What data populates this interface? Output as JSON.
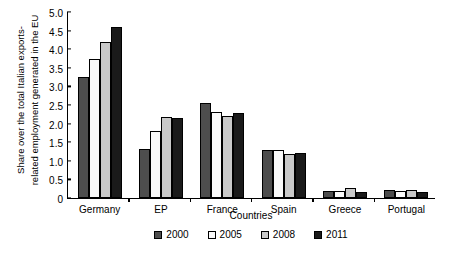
{
  "chart_data": {
    "type": "bar",
    "title": "",
    "xlabel": "Countries",
    "ylabel": "Share over the total Italian exports-related employment generated in the EU",
    "ylabel_lines": [
      "Share over the total Italian exports-",
      "related employment generated in the EU"
    ],
    "categories": [
      "Germany",
      "EP",
      "France",
      "Spain",
      "Greece",
      "Portugal"
    ],
    "series": [
      {
        "name": "2000",
        "color": "#4d4d4d",
        "values": [
          3.25,
          1.33,
          2.55,
          1.3,
          0.2,
          0.22
        ]
      },
      {
        "name": "2005",
        "color": "#fafafa",
        "values": [
          3.75,
          1.8,
          2.31,
          1.3,
          0.19,
          0.19
        ]
      },
      {
        "name": "2008",
        "color": "#c9c9c9",
        "values": [
          4.2,
          2.18,
          2.2,
          1.18,
          0.26,
          0.21
        ]
      },
      {
        "name": "2011",
        "color": "#1a1a1a",
        "values": [
          4.6,
          2.15,
          2.28,
          1.22,
          0.15,
          0.17
        ]
      }
    ],
    "ylim": [
      0,
      5.0
    ],
    "yticks": [
      "0",
      "0.5",
      "1.0",
      "1.5",
      "2.0",
      "2.5",
      "3.0",
      "3.5",
      "4.0",
      "4.5",
      "5.0"
    ],
    "ytick_values": [
      0,
      0.5,
      1.0,
      1.5,
      2.0,
      2.5,
      3.0,
      3.5,
      4.0,
      4.5,
      5.0
    ],
    "grid": false,
    "legend_position": "bottom",
    "legend": [
      "2000",
      "2005",
      "2008",
      "2011"
    ]
  }
}
